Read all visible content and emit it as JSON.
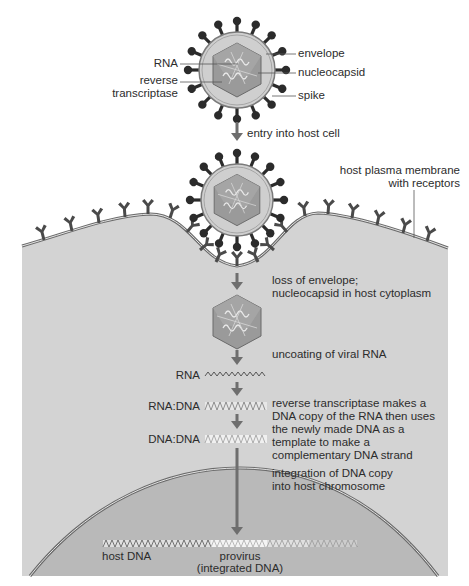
{
  "diagram": {
    "virion_labels": {
      "rna": "RNA",
      "reverse_transcriptase_line1": "reverse",
      "reverse_transcriptase_line2": "transcriptase",
      "envelope": "envelope",
      "nucleocapsid": "nucleocapsid",
      "spike": "spike"
    },
    "steps": {
      "entry": "entry into host cell",
      "membrane_line1": "host plasma membrane",
      "membrane_line2": "with receptors",
      "loss_line1": "loss of envelope;",
      "loss_line2": "nucleocapsid in host cytoplasm",
      "uncoating": "uncoating of viral RNA",
      "rt_line1": "reverse transcriptase makes a",
      "rt_line2": "DNA copy of the RNA then uses",
      "rt_line3": "the newly made DNA as a",
      "rt_line4": "template to make a",
      "rt_line5": "complementary DNA strand",
      "integration_line1": "integration of DNA copy",
      "integration_line2": "into host chromosome"
    },
    "strand_labels": {
      "rna": "RNA",
      "rna_dna": "RNA:DNA",
      "dna_dna": "DNA:DNA"
    },
    "chromosome_labels": {
      "host_dna": "host DNA",
      "provirus_line1": "provirus",
      "provirus_line2": "(integrated DNA)"
    },
    "colors": {
      "cytoplasm": "#d3d3d3",
      "nucleus": "#b9b9b9",
      "envelope": "#cfcfcf",
      "capsid": "#9a9a9a",
      "spike": "#2b2b2b",
      "receptor": "#4a4a4a",
      "arrow": "#6e6e6e"
    }
  }
}
